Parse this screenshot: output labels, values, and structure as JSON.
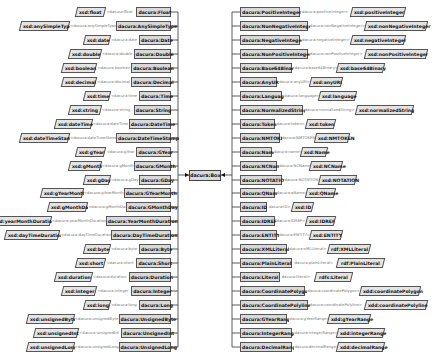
{
  "center": {
    "label": "dacura:Box"
  },
  "left_rows": [
    {
      "xsd": "xsd:float",
      "prop": "<dacura:float",
      "dacura": "dacura:Float"
    },
    {
      "xsd": "xsd:anySimpleType",
      "prop": "<dacura:anySimpleType",
      "dacura": "dacura:AnySimpleType"
    },
    {
      "xsd": "xsd:date",
      "prop": "<dacura:date",
      "dacura": "dacura:Date"
    },
    {
      "xsd": "xsd:double",
      "prop": "<dacura:double",
      "dacura": "dacura:Double"
    },
    {
      "xsd": "xsd:boolean",
      "prop": "<dacura:boolean",
      "dacura": "dacura:Boolean"
    },
    {
      "xsd": "xsd:decimal",
      "prop": "<dacura:decimal",
      "dacura": "dacura:Decimal"
    },
    {
      "xsd": "xsd:time",
      "prop": "<dacura:time",
      "dacura": "dacura:Time"
    },
    {
      "xsd": "xsd:string",
      "prop": "<dacura:string",
      "dacura": "dacura:String"
    },
    {
      "xsd": "xsd:dateTime",
      "prop": "<dacura:dateTime",
      "dacura": "dacura:DateTime"
    },
    {
      "xsd": "xsd:dateTimeStamp",
      "prop": "<dacura:dateTimeStamp",
      "dacura": "dacura:DateTimeStamp"
    },
    {
      "xsd": "xsd:gYear",
      "prop": "<dacura:gYear",
      "dacura": "dacura:GYear"
    },
    {
      "xsd": "xsd:gMonth",
      "prop": "<dacura:gMonth",
      "dacura": "dacura:GMonth"
    },
    {
      "xsd": "xsd:gDay",
      "prop": "<dacura:gDay",
      "dacura": "dacura:GDay"
    },
    {
      "xsd": "xsd:gYearMonth",
      "prop": "<dacura:gYearMonth",
      "dacura": "dacura:GYearMonth"
    },
    {
      "xsd": "xsd:gMonthDay",
      "prop": "<dacura:gMonthDay",
      "dacura": "dacura:GMonthDay"
    },
    {
      "xsd": "xsd:yearMonthDuration",
      "prop": "<dacura:yearMonthDuration",
      "dacura": "dacura:YearMonthDuration"
    },
    {
      "xsd": "xsd:dayTimeDuration",
      "prop": "<dacura:dayTimeDuration",
      "dacura": "dacura:DayTimeDuration"
    },
    {
      "xsd": "xsd:byte",
      "prop": "<dacura:byte",
      "dacura": "dacura:Byte"
    },
    {
      "xsd": "xsd:short",
      "prop": "<dacura:short",
      "dacura": "dacura:Short"
    },
    {
      "xsd": "xsd:duration",
      "prop": "<dacura:duration",
      "dacura": "dacura:Duration"
    },
    {
      "xsd": "xsd:integer",
      "prop": "<dacura:integer",
      "dacura": "dacura:Integer"
    },
    {
      "xsd": "xsd:long",
      "prop": "<dacura:long",
      "dacura": "dacura:Long"
    },
    {
      "xsd": "xsd:unsignedByte",
      "prop": "<dacura:unsignedByte",
      "dacura": "dacura:UnsignedByte"
    },
    {
      "xsd": "xsd:unsignedInt",
      "prop": "<dacura:unsignedInt",
      "dacura": "dacura:UnsignedInt"
    },
    {
      "xsd": "xsd:unsignedLong",
      "prop": "<dacura:unsignedLong",
      "dacura": "dacura:UnsignedLong"
    }
  ],
  "right_rows": [
    {
      "dacura": "dacura:PositiveInteger",
      "prop": "dacura:positiveInteger>",
      "xsd": "xsd:positiveInteger"
    },
    {
      "dacura": "dacura:NonNegativeInteger",
      "prop": "dacura:nonNegativeInteger>",
      "xsd": "xsd:nonNegativeInteger"
    },
    {
      "dacura": "dacura:NegativeInteger",
      "prop": "dacura:negativeInteger>",
      "xsd": "xsd:negativeInteger"
    },
    {
      "dacura": "dacura:NonPositiveInteger",
      "prop": "dacura:nonPositiveInteger>",
      "xsd": "xsd:nonPositiveInteger"
    },
    {
      "dacura": "dacura:Base64Binary",
      "prop": "dacura:base64Binary>",
      "xsd": "xsd:base64Binary"
    },
    {
      "dacura": "dacura:AnyURI",
      "prop": "dacura:anyURI>",
      "xsd": "xsd:anyURI"
    },
    {
      "dacura": "dacura:Language",
      "prop": "dacura:language>",
      "xsd": "xsd:language"
    },
    {
      "dacura": "dacura:NormalizedString",
      "prop": "dacura:normalizedString>",
      "xsd": "xsd:normalizedString"
    },
    {
      "dacura": "dacura:Token",
      "prop": "dacura:token>",
      "xsd": "xsd:token"
    },
    {
      "dacura": "dacura:NMTOKEN",
      "prop": "dacura:NMTOKEN>",
      "xsd": "xsd:NMTOKEN"
    },
    {
      "dacura": "dacura:Name",
      "prop": "dacura:name>",
      "xsd": "xsd:Name"
    },
    {
      "dacura": "dacura:NCName",
      "prop": "dacura:NCName>",
      "xsd": "xsd:NCName"
    },
    {
      "dacura": "dacura:NOTATION",
      "prop": "dacura:NOTATION>",
      "xsd": "xsd:NOTATION"
    },
    {
      "dacura": "dacura:QName",
      "prop": "dacura:qName>",
      "xsd": "xsd:QName"
    },
    {
      "dacura": "dacura:ID",
      "prop": "dacura:ID>",
      "xsd": "xsd:ID"
    },
    {
      "dacura": "dacura:IDREF",
      "prop": "dacura:IDREF>",
      "xsd": "xsd:IDREF"
    },
    {
      "dacura": "dacura:ENTITY",
      "prop": "dacura:ENTITY>",
      "xsd": "xsd:ENTITY"
    },
    {
      "dacura": "dacura:XMLLiteral",
      "prop": "dacura:xMLLiteral>",
      "xsd": "rdf:XMLLiteral"
    },
    {
      "dacura": "dacura:PlainLiteral",
      "prop": "dacura:plainLiteral>",
      "xsd": "rdf:PlainLiteral"
    },
    {
      "dacura": "dacura:Literal",
      "prop": "dacura:literal>",
      "xsd": "rdfs:Literal"
    },
    {
      "dacura": "dacura:CoordinatePolygon",
      "prop": "dacura:coordinatePolygon>",
      "xsd": "xdd:coordinatePolygon"
    },
    {
      "dacura": "dacura:CoordinatePolyline",
      "prop": "dacura:coordinatePolyline>",
      "xsd": "xdd:coordinatePolyline"
    },
    {
      "dacura": "dacura:GYearRange",
      "prop": "dacura:gYearRange>",
      "xsd": "xdd:gYearRange"
    },
    {
      "dacura": "dacura:IntegerRange",
      "prop": "dacura:integerRange>",
      "xsd": "xdd:integerRange"
    },
    {
      "dacura": "dacura:DecimalRange",
      "prop": "dacura:decimalRange>",
      "xsd": "xdd:decimalRange"
    }
  ]
}
